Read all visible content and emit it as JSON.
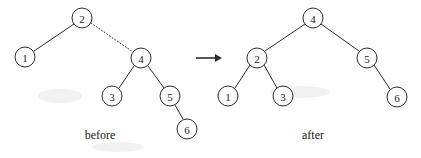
{
  "figure": {
    "title_visible": false,
    "background_color": "#fefefe",
    "stroke_color": "#2b2b2b",
    "node_fill_color": "#ffffff",
    "node_radius": 10
  },
  "captions": {
    "before": "before",
    "after": "after"
  },
  "transition": {
    "arrow_icon": "right-arrow-icon",
    "from_x": 196,
    "to_x": 221,
    "y": 58
  },
  "before_tree": {
    "label": "before",
    "nodes": [
      {
        "id": "b2",
        "value": "2",
        "x": 82,
        "y": 18
      },
      {
        "id": "b1",
        "value": "1",
        "x": 25,
        "y": 57
      },
      {
        "id": "b4",
        "value": "4",
        "x": 141,
        "y": 58
      },
      {
        "id": "b3",
        "value": "3",
        "x": 112,
        "y": 96
      },
      {
        "id": "b5",
        "value": "5",
        "x": 170,
        "y": 96
      },
      {
        "id": "b6",
        "value": "6",
        "x": 187,
        "y": 129
      }
    ],
    "edges": [
      {
        "from": "b2",
        "to": "b1",
        "style": "solid"
      },
      {
        "from": "b2",
        "to": "b4",
        "style": "dotted"
      },
      {
        "from": "b4",
        "to": "b3",
        "style": "solid"
      },
      {
        "from": "b4",
        "to": "b5",
        "style": "solid"
      },
      {
        "from": "b5",
        "to": "b6",
        "style": "solid"
      }
    ]
  },
  "after_tree": {
    "label": "after",
    "nodes": [
      {
        "id": "a4",
        "value": "4",
        "x": 313,
        "y": 18
      },
      {
        "id": "a2",
        "value": "2",
        "x": 257,
        "y": 58
      },
      {
        "id": "a5",
        "value": "5",
        "x": 367,
        "y": 58
      },
      {
        "id": "a1",
        "value": "1",
        "x": 228,
        "y": 96
      },
      {
        "id": "a3",
        "value": "3",
        "x": 283,
        "y": 96
      },
      {
        "id": "a6",
        "value": "6",
        "x": 397,
        "y": 97
      }
    ],
    "edges": [
      {
        "from": "a4",
        "to": "a2",
        "style": "solid"
      },
      {
        "from": "a4",
        "to": "a5",
        "style": "solid"
      },
      {
        "from": "a2",
        "to": "a1",
        "style": "solid"
      },
      {
        "from": "a2",
        "to": "a3",
        "style": "solid"
      },
      {
        "from": "a5",
        "to": "a6",
        "style": "solid"
      }
    ]
  },
  "caption_positions": {
    "before_x": 100,
    "before_y": 135,
    "after_x": 313,
    "after_y": 135
  }
}
